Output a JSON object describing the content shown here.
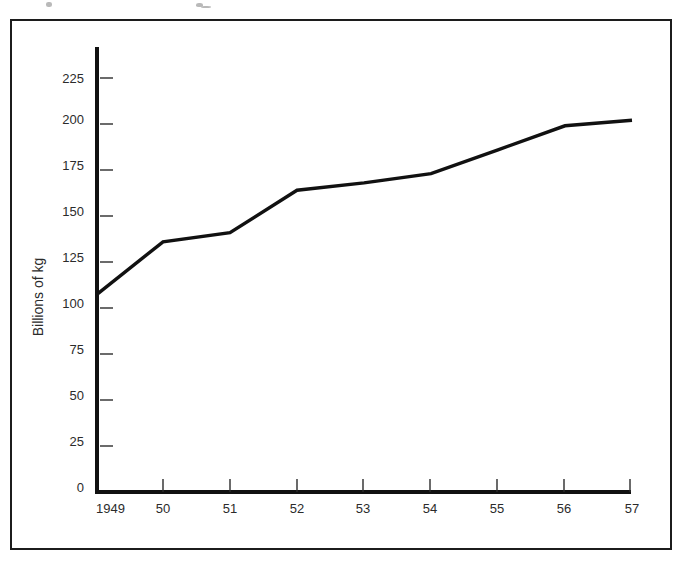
{
  "figure": {
    "border_color": "#1c1c1c",
    "background": "#ffffff"
  },
  "chart_data": {
    "type": "line",
    "title": "",
    "subtitle": "",
    "xlabel": "",
    "ylabel": "Billions of kg",
    "x": [
      "1949",
      "50",
      "51",
      "52",
      "53",
      "54",
      "55",
      "56",
      "57"
    ],
    "categories": [
      "1949",
      "50",
      "51",
      "52",
      "53",
      "54",
      "55",
      "56",
      "57"
    ],
    "values": [
      107,
      136,
      141,
      164,
      168,
      173,
      186,
      199,
      202
    ],
    "series": [
      {
        "name": "Billions of kg",
        "values": [
          107,
          136,
          141,
          164,
          168,
          173,
          186,
          199,
          202
        ],
        "color": "#111111"
      }
    ],
    "xlim": [
      1949,
      1957
    ],
    "ylim": [
      0,
      237
    ],
    "yticks": [
      0,
      25,
      50,
      75,
      100,
      125,
      150,
      175,
      200,
      225
    ],
    "ytick_labels": [
      "0",
      "25",
      "50",
      "75",
      "100",
      "125",
      "150",
      "175",
      "200",
      "225"
    ],
    "xtick_labels": [
      "1949",
      "50",
      "51",
      "52",
      "53",
      "54",
      "55",
      "56",
      "57"
    ],
    "grid": false,
    "legend": "none",
    "line_color": "#111111",
    "axis_color": "#111111",
    "markers": false,
    "annotations": []
  }
}
